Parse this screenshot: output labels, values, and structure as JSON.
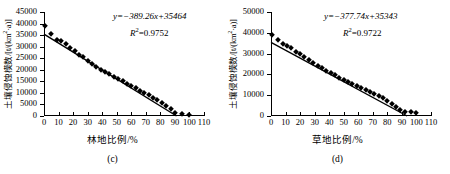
{
  "figure": {
    "panels": [
      {
        "caption": "(c)",
        "ylabel_main": "土壤侵蚀模数/[t/(km",
        "ylabel_sup": "2",
        "ylabel_tail": "·a)]",
        "xlabel": "林地比例/%",
        "equation": "y=−389.26x+35464",
        "r2_label": "R",
        "r2_sup": "2",
        "r2_value": "=0.9752"
      },
      {
        "caption": "(d)",
        "ylabel_main": "土壤侵蚀模数/[t/(km",
        "ylabel_sup": "2",
        "ylabel_tail": "·a)]",
        "xlabel": "草地比例/%",
        "equation": "y=−377.74x+35343",
        "r2_label": "R",
        "r2_sup": "2",
        "r2_value": "=0.9722"
      }
    ]
  },
  "chart_data": [
    {
      "type": "scatter",
      "panel": "(c)",
      "title": "",
      "xlabel": "林地比例/%",
      "ylabel": "土壤侵蚀模数/[t/(km2·a)]",
      "xlim": [
        0,
        110
      ],
      "ylim": [
        0,
        45000
      ],
      "xticks": [
        0,
        10,
        20,
        30,
        40,
        50,
        60,
        70,
        80,
        90,
        100,
        110
      ],
      "yticks": [
        0,
        5000,
        10000,
        15000,
        20000,
        25000,
        30000,
        35000,
        40000,
        45000
      ],
      "grid": false,
      "legend": null,
      "annotations": [
        "y=−389.26x+35464",
        "R2=0.9752"
      ],
      "fit": {
        "type": "linear",
        "slope": -389.26,
        "intercept": 35464,
        "r2": 0.9752
      },
      "marker": "diamond",
      "x": [
        1,
        5,
        9,
        12,
        15,
        18,
        21,
        24,
        27,
        30,
        33,
        36,
        39,
        42,
        45,
        48,
        51,
        54,
        57,
        60,
        63,
        66,
        69,
        72,
        75,
        78,
        81,
        84,
        87,
        90,
        95,
        100
      ],
      "y": [
        39000,
        35500,
        33000,
        32500,
        31000,
        29500,
        28000,
        26500,
        25500,
        24000,
        22500,
        21000,
        20000,
        19000,
        18000,
        17000,
        16000,
        15000,
        14000,
        13000,
        12000,
        11000,
        10000,
        9000,
        8000,
        7000,
        5500,
        4500,
        3000,
        1300,
        900,
        600
      ]
    },
    {
      "type": "scatter",
      "panel": "(d)",
      "title": "",
      "xlabel": "草地比例/%",
      "ylabel": "土壤侵蚀模数/[t/(km2·a)]",
      "xlim": [
        0,
        110
      ],
      "ylim": [
        0,
        50000
      ],
      "xticks": [
        0,
        10,
        20,
        30,
        40,
        50,
        60,
        70,
        80,
        90,
        100,
        110
      ],
      "yticks": [
        0,
        10000,
        20000,
        30000,
        40000,
        50000
      ],
      "grid": false,
      "legend": null,
      "annotations": [
        "y=−377.74x+35343",
        "R2=0.9722"
      ],
      "fit": {
        "type": "linear",
        "slope": -377.74,
        "intercept": 35343,
        "r2": 0.9722
      },
      "marker": "diamond",
      "x": [
        1,
        5,
        8,
        11,
        14,
        17,
        20,
        23,
        26,
        29,
        32,
        35,
        38,
        41,
        44,
        47,
        50,
        53,
        56,
        59,
        62,
        65,
        68,
        71,
        74,
        77,
        80,
        83,
        86,
        89,
        92,
        96,
        100
      ],
      "y": [
        39000,
        36500,
        34500,
        33500,
        32500,
        31000,
        30000,
        28500,
        27000,
        25500,
        24000,
        23000,
        21500,
        20500,
        19500,
        18500,
        17500,
        16500,
        15500,
        14500,
        13500,
        12500,
        11500,
        10500,
        9500,
        8500,
        7000,
        6000,
        4500,
        3000,
        1700,
        1700,
        1500
      ]
    }
  ]
}
